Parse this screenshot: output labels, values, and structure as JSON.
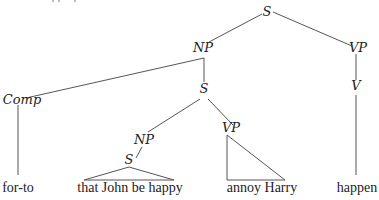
{
  "diagram": {
    "type": "syntax-tree",
    "nodes": {
      "root_s": "S",
      "np_top": "NP",
      "vp_top": "VP",
      "comp": "Comp",
      "s_mid": "S",
      "v": "V",
      "np_low": "NP",
      "vp_low": "VP",
      "s_low": "S"
    },
    "leaves": {
      "comp_leaf": "for-to",
      "s_low_leaf": "that John be happy",
      "vp_low_leaf": "annoy Harry",
      "v_leaf": "happen"
    },
    "colors": {
      "text": "#222222",
      "lines": "#555555",
      "background": "#ffffff"
    }
  }
}
